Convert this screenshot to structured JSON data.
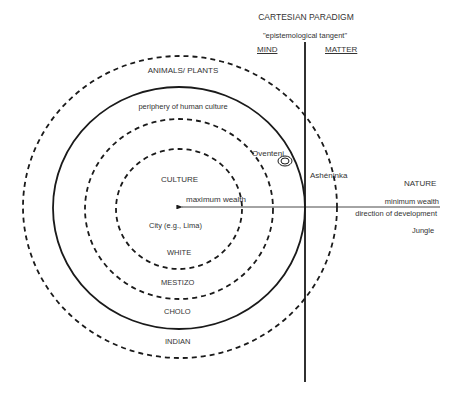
{
  "header": {
    "title": "CARTESIAN PARADIGM",
    "subtitle": "\"epistemological tangent\"",
    "left_label": "MIND",
    "right_label": "MATTER"
  },
  "rings": {
    "outer": "ANIMALS/ PLANTS",
    "periphery": "periphery of human culture",
    "culture": "CULTURE",
    "city": "City (e.g., Lima)",
    "white": "WHITE",
    "mestizo": "MESTIZO",
    "cholo": "CHOLO",
    "indian": "INDIAN"
  },
  "groups": {
    "oventeni": "Oventeni",
    "asheninka": "Ashéninka"
  },
  "right_side": {
    "nature": "NATURE",
    "minimum_wealth": "minimum wealth",
    "direction": "direction of development",
    "jungle": "Jungle"
  },
  "arrow": {
    "maximum_wealth": "maximum wealth"
  },
  "colors": {
    "stroke": "#1a1a1a",
    "text": "#333333",
    "background": "#ffffff"
  }
}
